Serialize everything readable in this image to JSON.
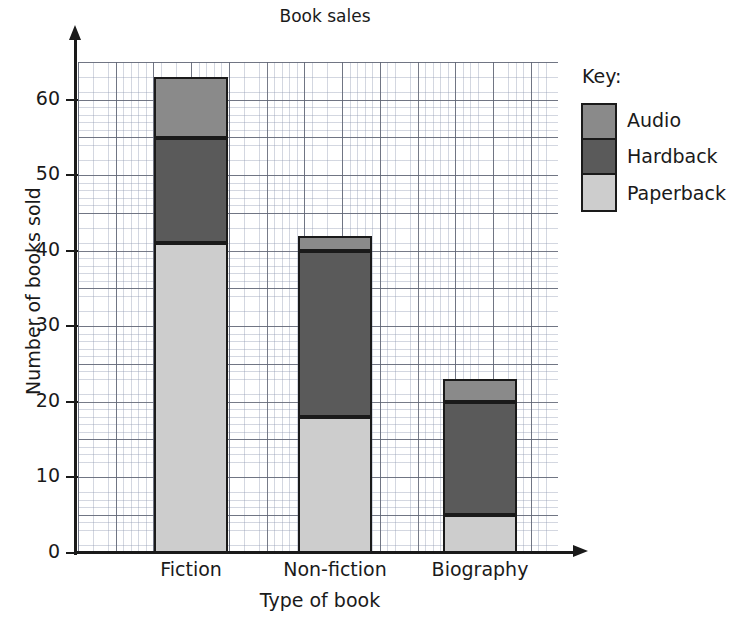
{
  "chart_data": {
    "type": "bar",
    "subtype": "stacked-bar",
    "title": "Book sales",
    "xlabel": "Type of book",
    "ylabel": "Number of books sold",
    "categories": [
      "Fiction",
      "Non-fiction",
      "Biography"
    ],
    "series": [
      {
        "name": "Paperback",
        "values": [
          41,
          18,
          5
        ],
        "color": "#cdcdcd"
      },
      {
        "name": "Hardback",
        "values": [
          14,
          22,
          15
        ],
        "color": "#5a5a5a"
      },
      {
        "name": "Audio",
        "values": [
          8,
          2,
          3
        ],
        "color": "#8a8a8a"
      }
    ],
    "cumulative_tops": {
      "Fiction": {
        "paperback_top": 41,
        "hardback_top": 55,
        "audio_top": 63
      },
      "Non-fiction": {
        "paperback_top": 18,
        "hardback_top": 40,
        "audio_top": 42
      },
      "Biography": {
        "paperback_top": 5,
        "hardback_top": 20,
        "audio_top": 23
      }
    },
    "totals": [
      63,
      42,
      23
    ],
    "ylim": [
      0,
      65
    ],
    "ytick_labels": [
      "0",
      "10",
      "20",
      "30",
      "40",
      "50",
      "60"
    ],
    "ytick_values": [
      0,
      10,
      20,
      30,
      40,
      50,
      60
    ],
    "grid": "on",
    "grid_minor_step": 1,
    "grid_major_step": 5,
    "legend_position": "right"
  },
  "legend": {
    "title": "Key:",
    "entries": [
      {
        "label": "Audio",
        "color": "#8a8a8a"
      },
      {
        "label": "Hardback",
        "color": "#5a5a5a"
      },
      {
        "label": "Paperback",
        "color": "#cdcdcd"
      }
    ]
  },
  "colors": {
    "audio": "#8a8a8a",
    "hardback": "#5a5a5a",
    "paperback": "#cdcdcd",
    "axis": "#1a1a1a",
    "grid_minor": "#aeb6c6",
    "grid_major": "#6d7280",
    "background": "#ffffff"
  }
}
